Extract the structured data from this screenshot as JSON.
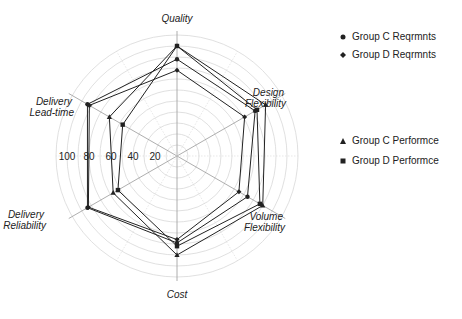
{
  "chart_data": {
    "type": "radar",
    "title": "",
    "axes": [
      "Quality",
      "Design Flexibility",
      "Volume Flexibility",
      "Cost",
      "Delivery Reliability",
      "Delivery Lead-time"
    ],
    "axis_labels": [
      {
        "lines": [
          "Quality"
        ]
      },
      {
        "lines": [
          "Design",
          "Flexibility"
        ]
      },
      {
        "lines": [
          "Volume",
          "Flexibility"
        ]
      },
      {
        "lines": [
          "Cost"
        ]
      },
      {
        "lines": [
          "Delivery",
          "Reliability"
        ]
      },
      {
        "lines": [
          "Delivery",
          "Lead-time"
        ]
      }
    ],
    "radial_ticks": [
      20,
      40,
      60,
      80,
      100
    ],
    "rlim": [
      0,
      110
    ],
    "grid": true,
    "legend_position": "right",
    "series": [
      {
        "name": "Group C Reqrmnts",
        "marker": "circle",
        "values": [
          88,
          82,
          74,
          79,
          94,
          94
        ]
      },
      {
        "name": "Group D Reqrmnts",
        "marker": "diamond",
        "values": [
          78,
          71,
          65,
          76,
          93,
          92
        ]
      },
      {
        "name": "Group C Performce",
        "marker": "triangle",
        "values": [
          100,
          93,
          90,
          90,
          67,
          71
        ]
      },
      {
        "name": "Group D Performce",
        "marker": "square",
        "values": [
          100,
          84,
          87,
          82,
          62,
          57
        ]
      }
    ]
  },
  "legend": {
    "items": [
      "Group C Reqrmnts",
      "Group D Reqrmnts",
      "Group C Performce",
      "Group D Performce"
    ]
  },
  "colors": {
    "line": "#222222",
    "grid": "#d8d8d8",
    "axis": "#999999"
  }
}
